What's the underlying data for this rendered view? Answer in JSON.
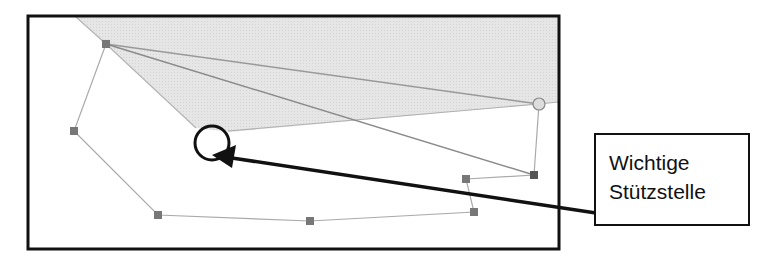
{
  "diagram": {
    "label": {
      "line1": "Wichtige",
      "line2": "Stützstelle"
    },
    "colors": {
      "frame": "#111111",
      "shaded_region": "#e3e3e3",
      "polyline": "#aaaaaa",
      "nodes": "#707070",
      "highlight_circle": "#111111",
      "arrow": "#111111"
    },
    "frame": {
      "x": 27,
      "y": 15,
      "width": 533,
      "height": 235
    },
    "nodes": [
      {
        "x": 106,
        "y": 44,
        "shape": "square"
      },
      {
        "x": 74,
        "y": 131,
        "shape": "square"
      },
      {
        "x": 158,
        "y": 215,
        "shape": "square"
      },
      {
        "x": 310,
        "y": 221,
        "shape": "square"
      },
      {
        "x": 474,
        "y": 212,
        "shape": "square"
      },
      {
        "x": 466,
        "y": 179,
        "shape": "square"
      },
      {
        "x": 534,
        "y": 175,
        "shape": "square"
      },
      {
        "x": 539,
        "y": 104,
        "shape": "circle"
      }
    ],
    "highlight": {
      "cx": 212,
      "cy": 143,
      "r": 17
    },
    "arrow": {
      "from": [
        596,
        213
      ],
      "to": [
        215,
        156
      ]
    }
  }
}
